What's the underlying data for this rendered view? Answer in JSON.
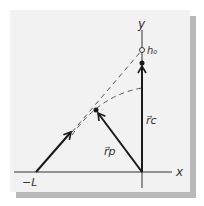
{
  "diagram": {
    "labels": {
      "x_axis": "x",
      "y_axis": "y",
      "neg_L": "−L",
      "h0": "h₀",
      "r_p": "r⃗p",
      "r_c": "r⃗c"
    },
    "colors": {
      "card": "#f2f2f2",
      "shadow": "#b9b9b9",
      "ink": "#1a1a1a",
      "dashed": "#555555"
    }
  }
}
